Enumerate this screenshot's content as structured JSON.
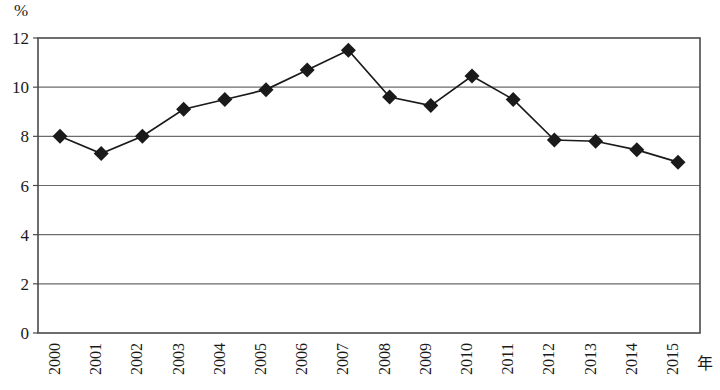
{
  "chart_data": {
    "type": "line",
    "title": "",
    "subtitle": "",
    "xlabel": "年",
    "ylabel": "%",
    "categories": [
      "2000",
      "2001",
      "2002",
      "2003",
      "2004",
      "2005",
      "2006",
      "2007",
      "2008",
      "2009",
      "2010",
      "2011",
      "2012",
      "2013",
      "2014",
      "2015"
    ],
    "values": [
      8.0,
      7.3,
      8.0,
      9.1,
      9.5,
      9.9,
      10.7,
      11.5,
      9.6,
      9.25,
      10.45,
      9.5,
      7.85,
      7.8,
      7.45,
      6.95
    ],
    "series": [
      {
        "name": "",
        "values": [
          8.0,
          7.3,
          8.0,
          9.1,
          9.5,
          9.9,
          10.7,
          11.5,
          9.6,
          9.25,
          10.45,
          9.5,
          7.85,
          7.8,
          7.45,
          6.95
        ]
      }
    ],
    "ylim": [
      0,
      12
    ],
    "yticks": [
      0,
      2,
      4,
      6,
      8,
      10,
      12
    ],
    "ytick_labels": [
      "0",
      "2",
      "4",
      "6",
      "8",
      "10",
      "12"
    ],
    "grid": true,
    "grid_axis": "y",
    "legend": false,
    "legend_position": "none",
    "marker": "diamond",
    "marker_color": "#1a1a1a",
    "line_color": "#1a1a1a",
    "plot_border": true,
    "xtick_rotation": -90
  },
  "axes": {
    "y_unit_label": "%",
    "x_unit_label": "年"
  }
}
